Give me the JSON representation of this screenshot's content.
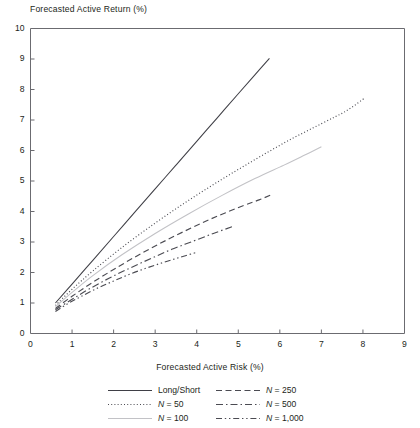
{
  "chart_data": {
    "type": "line",
    "title": "",
    "ylabel": "Forecasted Active Return (%)",
    "xlabel": "Forecasted Active Risk (%)",
    "xlim": [
      0,
      9
    ],
    "ylim": [
      0,
      10
    ],
    "xticks": [
      "0",
      "1",
      "2",
      "3",
      "4",
      "5",
      "6",
      "7",
      "8",
      "9"
    ],
    "yticks": [
      "0",
      "1",
      "2",
      "3",
      "4",
      "5",
      "6",
      "7",
      "8",
      "9",
      "10"
    ],
    "grid": false,
    "legend_position": "below-axes",
    "series": [
      {
        "name": "Long/Short",
        "style": "solid",
        "color": "#3f3f46",
        "x": [
          0.6,
          1.0,
          1.5,
          2.0,
          2.5,
          3.0,
          3.5,
          4.0,
          4.5,
          5.0,
          5.4,
          5.75
        ],
        "y": [
          1.0,
          1.62,
          2.4,
          3.18,
          3.96,
          4.74,
          5.52,
          6.3,
          7.08,
          7.86,
          8.48,
          9.02
        ]
      },
      {
        "name": "N = 50",
        "style": "dotted",
        "color": "#4b4b52",
        "x": [
          0.6,
          1.0,
          1.5,
          2.2,
          3.0,
          3.8,
          4.6,
          5.4,
          6.2,
          7.0,
          7.6,
          8.05
        ],
        "y": [
          0.92,
          1.45,
          2.05,
          2.82,
          3.62,
          4.36,
          5.05,
          5.7,
          6.32,
          6.88,
          7.3,
          7.73
        ]
      },
      {
        "name": "N = 100",
        "style": "solid",
        "color": "#c2c2c6",
        "x": [
          0.6,
          1.0,
          1.5,
          2.2,
          3.0,
          3.8,
          4.6,
          5.4,
          6.1,
          6.6,
          7.0
        ],
        "y": [
          0.88,
          1.35,
          1.9,
          2.58,
          3.28,
          3.92,
          4.52,
          5.08,
          5.52,
          5.85,
          6.12
        ]
      },
      {
        "name": "N = 250",
        "style": "dashed",
        "color": "#4b4b52",
        "x": [
          0.6,
          1.0,
          1.5,
          2.1,
          2.7,
          3.3,
          3.9,
          4.5,
          5.1,
          5.5,
          5.78
        ],
        "y": [
          0.82,
          1.22,
          1.68,
          2.18,
          2.65,
          3.08,
          3.48,
          3.85,
          4.18,
          4.38,
          4.54
        ]
      },
      {
        "name": "N = 500",
        "style": "dash-dot",
        "color": "#4b4b52",
        "x": [
          0.6,
          1.0,
          1.4,
          1.9,
          2.4,
          2.9,
          3.4,
          3.9,
          4.4,
          4.85
        ],
        "y": [
          0.78,
          1.12,
          1.45,
          1.82,
          2.15,
          2.46,
          2.76,
          3.02,
          3.28,
          3.5
        ]
      },
      {
        "name": "N = 1,000",
        "style": "dash-dot-dot",
        "color": "#4b4b52",
        "x": [
          0.6,
          0.9,
          1.2,
          1.6,
          2.0,
          2.4,
          2.8,
          3.2,
          3.6,
          4.0
        ],
        "y": [
          0.72,
          0.98,
          1.2,
          1.48,
          1.72,
          1.95,
          2.15,
          2.33,
          2.5,
          2.66
        ]
      }
    ]
  },
  "legend": {
    "items": [
      {
        "label": "Long/Short",
        "style": "solid"
      },
      {
        "label": "N = 250",
        "style": "dashed"
      },
      {
        "label": "N = 50",
        "style": "dotted"
      },
      {
        "label": "N = 500",
        "style": "dash-dot"
      },
      {
        "label": "N = 100",
        "style": "solid-light"
      },
      {
        "label": "N = 1,000",
        "style": "dash-dot-dot"
      }
    ]
  },
  "colors": {
    "axis": "#6b6b70",
    "line_dark": "#3f3f46",
    "line_mid": "#4b4b52",
    "line_light": "#c2c2c6",
    "text": "#231f20"
  }
}
